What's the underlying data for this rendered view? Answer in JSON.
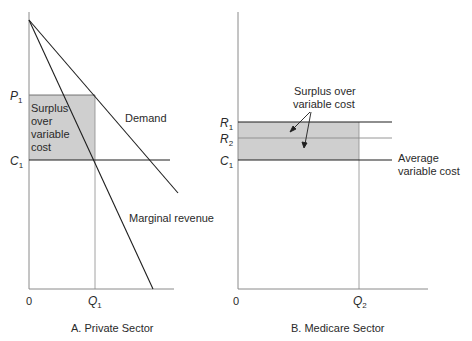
{
  "panel_a": {
    "caption": "A. Private Sector",
    "y_labels": {
      "p": "P",
      "p_sub": "1",
      "c": "C",
      "c_sub": "1"
    },
    "x_labels": {
      "origin": "0",
      "q": "Q",
      "q_sub": "1"
    },
    "shaded_label": [
      "Surplus",
      "over",
      "variable",
      "cost"
    ],
    "curve_labels": {
      "demand": "Demand",
      "marginal_revenue": "Marginal revenue"
    }
  },
  "panel_b": {
    "caption": "B. Medicare Sector",
    "y_labels": {
      "r1": "R",
      "r1_sub": "1",
      "r2": "R",
      "r2_sub": "2",
      "c": "C",
      "c_sub": "1"
    },
    "x_labels": {
      "origin": "0",
      "q": "Q",
      "q_sub": "2"
    },
    "surplus_label": [
      "Surplus over",
      "variable cost"
    ],
    "avc_label": [
      "Average",
      "variable cost"
    ]
  },
  "colors": {
    "shade": "#cfcfcf",
    "line": "#1e1e1e",
    "axis": "#8a8a8a"
  }
}
